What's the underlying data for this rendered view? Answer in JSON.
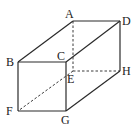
{
  "diagram": {
    "vertices": {
      "A": {
        "label": "A",
        "x": 73,
        "y": 21
      },
      "B": {
        "label": "B",
        "x": 18,
        "y": 62
      },
      "C": {
        "label": "C",
        "x": 66,
        "y": 62
      },
      "D": {
        "label": "D",
        "x": 120,
        "y": 21
      },
      "E": {
        "label": "E",
        "x": 73,
        "y": 71
      },
      "F": {
        "label": "F",
        "x": 18,
        "y": 111
      },
      "G": {
        "label": "G",
        "x": 66,
        "y": 111
      },
      "H": {
        "label": "H",
        "x": 120,
        "y": 71
      }
    },
    "solid_edges": [
      "AB",
      "AD",
      "BC",
      "CD",
      "BF",
      "CG",
      "FG",
      "DH",
      "GH"
    ],
    "dashed_edges": [
      "AE",
      "EH",
      "EF"
    ],
    "colors": {
      "line": "#2a2a2a",
      "text": "#222222",
      "background": "#ffffff"
    }
  }
}
